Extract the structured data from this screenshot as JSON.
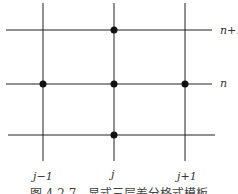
{
  "diagram": {
    "type": "finite-difference-stencil",
    "row_labels": {
      "top": "n+1",
      "middle": "n"
    },
    "col_labels": {
      "left": "j−1",
      "center": "j",
      "right": "j+1"
    },
    "nodes": [
      {
        "col": "j",
        "row": "n+1"
      },
      {
        "col": "j-1",
        "row": "n"
      },
      {
        "col": "j",
        "row": "n"
      },
      {
        "col": "j+1",
        "row": "n"
      },
      {
        "col": "j",
        "row": "n-1"
      }
    ],
    "caption": "图 4.2.7　显式三层差分格式模板"
  }
}
